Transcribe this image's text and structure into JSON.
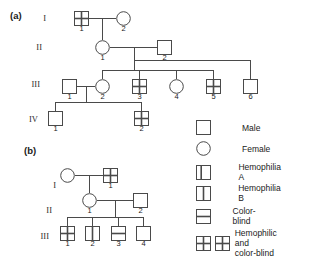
{
  "figure": {
    "type": "pedigree-chart",
    "panels": [
      {
        "label": "(a)",
        "generations": [
          "I",
          "II",
          "III",
          "IV"
        ],
        "individuals": [
          {
            "gen": "I",
            "num": "1",
            "sex": "male",
            "symbol": "hemophilic-and-color-blind"
          },
          {
            "gen": "I",
            "num": "2",
            "sex": "female",
            "symbol": "normal"
          },
          {
            "gen": "II",
            "num": "1",
            "sex": "female",
            "symbol": "normal"
          },
          {
            "gen": "II",
            "num": "2",
            "sex": "male",
            "symbol": "normal"
          },
          {
            "gen": "III",
            "num": "1",
            "sex": "male",
            "symbol": "normal"
          },
          {
            "gen": "III",
            "num": "2",
            "sex": "female",
            "symbol": "normal"
          },
          {
            "gen": "III",
            "num": "3",
            "sex": "male",
            "symbol": "hemophilic-and-color-blind"
          },
          {
            "gen": "III",
            "num": "4",
            "sex": "female",
            "symbol": "normal"
          },
          {
            "gen": "III",
            "num": "5",
            "sex": "male",
            "symbol": "hemophilic-and-color-blind"
          },
          {
            "gen": "III",
            "num": "6",
            "sex": "male",
            "symbol": "normal"
          },
          {
            "gen": "IV",
            "num": "1",
            "sex": "male",
            "symbol": "normal"
          },
          {
            "gen": "IV",
            "num": "2",
            "sex": "male",
            "symbol": "hemophilic-and-color-blind"
          }
        ]
      },
      {
        "label": "(b)",
        "generations": [
          "I",
          "II",
          "III"
        ],
        "individuals": [
          {
            "gen": "I",
            "num": "",
            "sex": "female",
            "symbol": "normal"
          },
          {
            "gen": "I",
            "num": "1",
            "sex": "male",
            "symbol": "hemophilic-and-color-blind"
          },
          {
            "gen": "II",
            "num": "1",
            "sex": "female",
            "symbol": "normal"
          },
          {
            "gen": "II",
            "num": "2",
            "sex": "male",
            "symbol": "normal"
          },
          {
            "gen": "III",
            "num": "1",
            "sex": "male",
            "symbol": "hemophilic-and-color-blind"
          },
          {
            "gen": "III",
            "num": "2",
            "sex": "male",
            "symbol": "hemophilia-b"
          },
          {
            "gen": "III",
            "num": "3",
            "sex": "male",
            "symbol": "color-blind"
          },
          {
            "gen": "III",
            "num": "4",
            "sex": "male",
            "symbol": "normal"
          }
        ]
      }
    ]
  },
  "legend": {
    "items": [
      {
        "symbol": "male",
        "label": "Male"
      },
      {
        "symbol": "female",
        "label": "Female"
      },
      {
        "symbol": "hemophilia-a",
        "label": "Hemophilia A"
      },
      {
        "symbol": "hemophilia-b",
        "label": "Hemophilia B"
      },
      {
        "symbol": "color-blind",
        "label": "Color-blind"
      },
      {
        "symbol": "hemophilic-and-color-blind",
        "label": "Hemophilic and\ncolor-blind"
      }
    ]
  },
  "panel_a": {
    "label": "(a)",
    "gen1": "I",
    "gen2": "II",
    "gen3": "III",
    "gen4": "IV",
    "i1": "1",
    "i2": "2",
    "ii1": "1",
    "ii2": "2",
    "iii1": "1",
    "iii2": "2",
    "iii3": "3",
    "iii4": "4",
    "iii5": "5",
    "iii6": "6",
    "iv1": "1",
    "iv2": "2"
  },
  "panel_b": {
    "label": "(b)",
    "gen1": "I",
    "gen2": "II",
    "gen3": "III",
    "i1": "1",
    "ii1": "1",
    "ii2": "2",
    "iii1": "1",
    "iii2": "2",
    "iii3": "3",
    "iii4": "4"
  },
  "colors": {
    "stroke": "#4a4a4a",
    "text": "#1a1a1a",
    "background": "#ffffff"
  }
}
